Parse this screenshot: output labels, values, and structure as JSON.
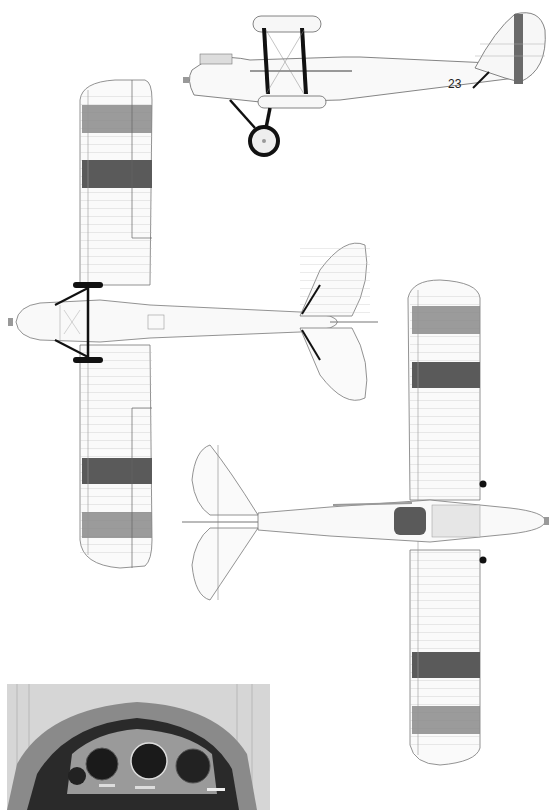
{
  "figure": {
    "type": "aircraft three-view technical drawing",
    "views": [
      {
        "name": "side-view",
        "label": "Side elevation"
      },
      {
        "name": "top-view-upper-wing",
        "label": "Plan view (upper wing)"
      },
      {
        "name": "bottom-view-lower-wing",
        "label": "Plan view (lower wing)"
      },
      {
        "name": "cockpit-photo",
        "label": "Instrument panel photo"
      }
    ],
    "markings": {
      "fuselage_number": "23"
    },
    "colors": {
      "outline": "#555555",
      "fill": "#f7f7f7",
      "stripe_dark": "#5a5a5a",
      "stripe_mid": "#8a8a8a",
      "strut": "#111111"
    }
  }
}
